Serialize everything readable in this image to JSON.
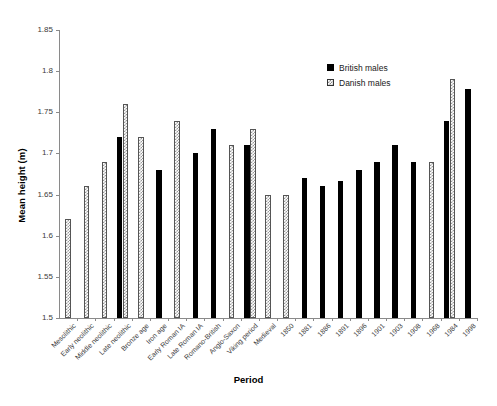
{
  "chart_data": {
    "type": "bar",
    "title": "",
    "xlabel": "Period",
    "ylabel": "Mean height (m)",
    "ylim": [
      1.5,
      1.85
    ],
    "yticks": [
      "1.5",
      "1.55",
      "1.6",
      "1.65",
      "1.7",
      "1.75",
      "1.8",
      "1.85"
    ],
    "ytick_values": [
      1.5,
      1.55,
      1.6,
      1.65,
      1.7,
      1.75,
      1.8,
      1.85
    ],
    "grid": false,
    "legend_position": "upper right",
    "categories": [
      "Mesolithic",
      "Early neolithic",
      "Middle neolithic",
      "Late neolithic",
      "Bronze age",
      "Iron age",
      "Early Roman IA",
      "Late Roman IA",
      "Romano-British",
      "Anglo-Saxon",
      "Viking period",
      "Medieval",
      "1850",
      "1881",
      "1886",
      "1891",
      "1896",
      "1901",
      "1903",
      "1908",
      "1968",
      "1984",
      "1998"
    ],
    "series": [
      {
        "name": "British males",
        "color": "#000000",
        "fill": "solid",
        "values": [
          null,
          null,
          null,
          1.72,
          null,
          1.68,
          null,
          1.7,
          1.73,
          null,
          1.71,
          null,
          null,
          1.67,
          1.66,
          1.667,
          1.68,
          1.69,
          1.71,
          1.69,
          null,
          1.74,
          1.778
        ]
      },
      {
        "name": "Danish males",
        "color": "#ffffff",
        "fill": "hatched",
        "values": [
          1.62,
          1.66,
          1.69,
          1.76,
          1.72,
          null,
          1.74,
          null,
          null,
          1.71,
          1.73,
          1.65,
          1.65,
          null,
          null,
          null,
          null,
          null,
          null,
          null,
          1.69,
          1.79,
          null
        ]
      }
    ]
  },
  "legend": {
    "items": [
      {
        "label": "British males",
        "style": "british"
      },
      {
        "label": "Danish males",
        "style": "danish"
      }
    ]
  }
}
